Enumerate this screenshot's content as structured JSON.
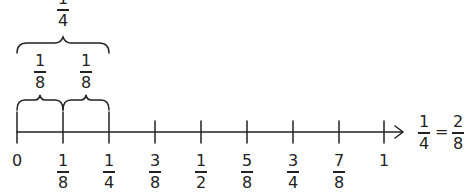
{
  "diagram": {
    "type": "number-line",
    "color": "#222222",
    "range": [
      0,
      1
    ],
    "step": "1/8",
    "ticks": [
      {
        "value": "0",
        "kind": "whole",
        "text": "0"
      },
      {
        "value": "1/8",
        "kind": "fraction",
        "num": "1",
        "den": "8"
      },
      {
        "value": "1/4",
        "kind": "fraction",
        "num": "1",
        "den": "4"
      },
      {
        "value": "3/8",
        "kind": "fraction",
        "num": "3",
        "den": "8"
      },
      {
        "value": "1/2",
        "kind": "fraction",
        "num": "1",
        "den": "2"
      },
      {
        "value": "5/8",
        "kind": "fraction",
        "num": "5",
        "den": "8"
      },
      {
        "value": "3/4",
        "kind": "fraction",
        "num": "3",
        "den": "4"
      },
      {
        "value": "7/8",
        "kind": "fraction",
        "num": "7",
        "den": "8"
      },
      {
        "value": "1",
        "kind": "whole",
        "text": "1"
      }
    ],
    "braces": {
      "top": {
        "label_num": "1",
        "label_den": "4",
        "from": "0",
        "to": "1/4"
      },
      "lower": [
        {
          "label_num": "1",
          "label_den": "8",
          "from": "0",
          "to": "1/8"
        },
        {
          "label_num": "1",
          "label_den": "8",
          "from": "1/8",
          "to": "1/4"
        }
      ]
    },
    "equation": {
      "left_num": "1",
      "left_den": "4",
      "equals": "=",
      "right_num": "2",
      "right_den": "8"
    }
  }
}
